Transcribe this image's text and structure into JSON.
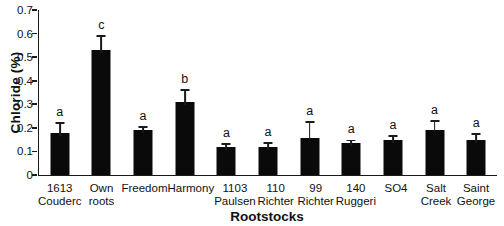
{
  "chart_data": {
    "type": "bar",
    "title": "",
    "xlabel": "Rootstocks",
    "ylabel": "Chloride (%)",
    "ylim": [
      0,
      0.7
    ],
    "yticks": [
      0,
      0.1,
      0.2,
      0.3,
      0.4,
      0.5,
      0.6,
      0.7
    ],
    "grid": false,
    "legend": null,
    "bar_color": "#0a0a0a",
    "axis_color": "#1a1a1a",
    "text_color": "#111111",
    "background_color": "#ffffff",
    "categories": [
      "1613 Couderc",
      "Own roots",
      "Freedom",
      "Harmony",
      "1103 Paulsen",
      "110 Richter",
      "99 Richter",
      "140 Ruggeri",
      "SO4",
      "Salt Creek",
      "Saint George"
    ],
    "category_lines": [
      [
        "1613",
        "Couderc"
      ],
      [
        "Own",
        "roots"
      ],
      [
        "Freedom"
      ],
      [
        "Harmony"
      ],
      [
        "1103",
        "Paulsen"
      ],
      [
        "110",
        "Richter"
      ],
      [
        "99",
        "Richter"
      ],
      [
        "140",
        "Ruggeri"
      ],
      [
        "SO4"
      ],
      [
        "Salt",
        "Creek"
      ],
      [
        "Saint",
        "George"
      ]
    ],
    "values": [
      0.18,
      0.53,
      0.19,
      0.31,
      0.12,
      0.12,
      0.155,
      0.135,
      0.15,
      0.19,
      0.15
    ],
    "errors": [
      0.04,
      0.06,
      0.015,
      0.05,
      0.012,
      0.017,
      0.07,
      0.012,
      0.015,
      0.04,
      0.025
    ],
    "sig_letters": [
      "a",
      "c",
      "a",
      "b",
      "a",
      "a",
      "a",
      "a",
      "a",
      "a",
      "a"
    ]
  }
}
